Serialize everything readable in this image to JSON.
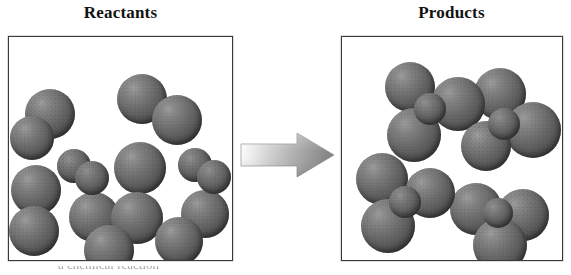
{
  "figure": {
    "kind": "chemical-reaction-particulate-diagram",
    "arrow_icon": "right-block-arrow-icon",
    "arrow_direction": "right",
    "caption": "a chemical reaction"
  },
  "colors": {
    "background": "#ffffff",
    "box_border": "#3a3a3a",
    "title_text": "#121212",
    "atom_large": "#5c5c5c",
    "atom_small": "#626262",
    "arrow_light": "#f2f2f2",
    "arrow_dark": "#7d7d7d"
  },
  "panels": [
    {
      "id": "reactants",
      "title": "Reactants",
      "molecule_count": 8,
      "molecules": [
        {
          "type": "large-diatomic",
          "atoms": [
            {
              "cx": 41,
              "cy": 77,
              "r": 25,
              "size": "large"
            },
            {
              "cx": 23,
              "cy": 101,
              "r": 22,
              "size": "large"
            }
          ]
        },
        {
          "type": "large-diatomic",
          "atoms": [
            {
              "cx": 133,
              "cy": 62,
              "r": 25,
              "size": "large"
            },
            {
              "cx": 168,
              "cy": 83,
              "r": 25,
              "size": "large"
            }
          ]
        },
        {
          "type": "large-diatomic",
          "atoms": [
            {
              "cx": 131,
              "cy": 131,
              "r": 26,
              "size": "large"
            },
            {
              "cx": 128,
              "cy": 181,
              "r": 26,
              "size": "large"
            }
          ]
        },
        {
          "type": "large-diatomic",
          "atoms": [
            {
              "cx": 27,
              "cy": 153,
              "r": 25,
              "size": "large"
            },
            {
              "cx": 25,
              "cy": 194,
              "r": 25,
              "size": "large"
            }
          ]
        },
        {
          "type": "large-diatomic",
          "atoms": [
            {
              "cx": 85,
              "cy": 180,
              "r": 25,
              "size": "large"
            },
            {
              "cx": 100,
              "cy": 213,
              "r": 25,
              "size": "large"
            }
          ]
        },
        {
          "type": "large-diatomic",
          "atoms": [
            {
              "cx": 196,
              "cy": 177,
              "r": 24,
              "size": "large"
            },
            {
              "cx": 170,
              "cy": 204,
              "r": 24,
              "size": "large"
            }
          ]
        },
        {
          "type": "small-diatomic",
          "atoms": [
            {
              "cx": 65,
              "cy": 129,
              "r": 17,
              "size": "small"
            },
            {
              "cx": 83,
              "cy": 141,
              "r": 17,
              "size": "small"
            }
          ]
        },
        {
          "type": "small-diatomic",
          "atoms": [
            {
              "cx": 186,
              "cy": 128,
              "r": 17,
              "size": "small"
            },
            {
              "cx": 205,
              "cy": 140,
              "r": 17,
              "size": "small"
            }
          ]
        }
      ]
    },
    {
      "id": "products",
      "title": "Products",
      "molecule_count": 4,
      "molecules": [
        {
          "type": "cluster-3large-1small",
          "atoms": [
            {
              "cx": 68,
              "cy": 50,
              "r": 25,
              "size": "large"
            },
            {
              "cx": 116,
              "cy": 67,
              "r": 27,
              "size": "large"
            },
            {
              "cx": 72,
              "cy": 98,
              "r": 27,
              "size": "large"
            },
            {
              "cx": 88,
              "cy": 72,
              "r": 16,
              "size": "small"
            }
          ]
        },
        {
          "type": "cluster-3large-1small",
          "atoms": [
            {
              "cx": 158,
              "cy": 57,
              "r": 26,
              "size": "large"
            },
            {
              "cx": 191,
              "cy": 93,
              "r": 28,
              "size": "large"
            },
            {
              "cx": 144,
              "cy": 109,
              "r": 25,
              "size": "large"
            },
            {
              "cx": 162,
              "cy": 87,
              "r": 16,
              "size": "small"
            }
          ]
        },
        {
          "type": "cluster-3large-1small",
          "atoms": [
            {
              "cx": 40,
              "cy": 142,
              "r": 26,
              "size": "large"
            },
            {
              "cx": 88,
              "cy": 156,
              "r": 25,
              "size": "large"
            },
            {
              "cx": 46,
              "cy": 189,
              "r": 27,
              "size": "large"
            },
            {
              "cx": 63,
              "cy": 165,
              "r": 16,
              "size": "small"
            }
          ]
        },
        {
          "type": "cluster-3large-1small",
          "atoms": [
            {
              "cx": 134,
              "cy": 172,
              "r": 26,
              "size": "large"
            },
            {
              "cx": 181,
              "cy": 178,
              "r": 26,
              "size": "large"
            },
            {
              "cx": 158,
              "cy": 208,
              "r": 27,
              "size": "large"
            },
            {
              "cx": 156,
              "cy": 176,
              "r": 15,
              "size": "small"
            }
          ]
        }
      ]
    }
  ]
}
